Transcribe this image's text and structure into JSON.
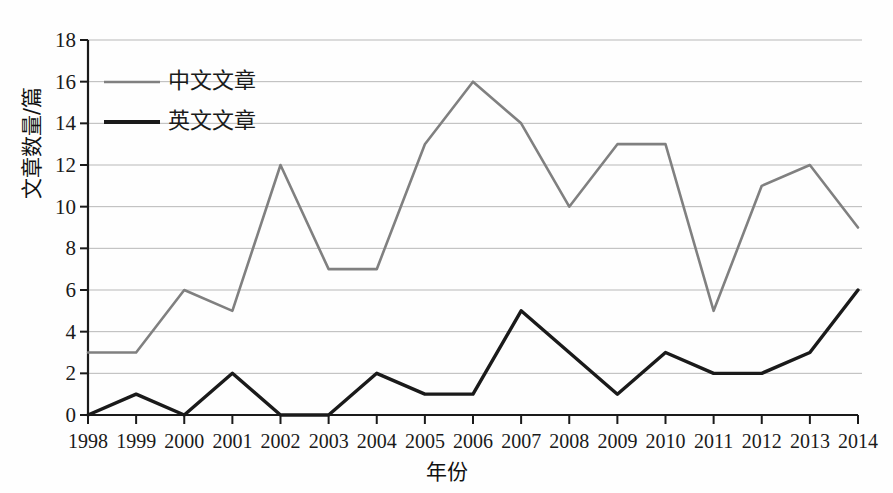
{
  "chart_data": {
    "type": "line",
    "title": "",
    "xlabel": "年份",
    "ylabel": "文章数量/篇",
    "categories": [
      "1998",
      "1999",
      "2000",
      "2001",
      "2002",
      "2003",
      "2004",
      "2005",
      "2006",
      "2007",
      "2008",
      "2009",
      "2010",
      "2011",
      "2012",
      "2013",
      "2014"
    ],
    "x": [
      1998,
      1999,
      2000,
      2001,
      2002,
      2003,
      2004,
      2005,
      2006,
      2007,
      2008,
      2009,
      2010,
      2011,
      2012,
      2013,
      2014
    ],
    "series": [
      {
        "name": "中文文章",
        "color": "#808080",
        "values": [
          3,
          3,
          6,
          5,
          12,
          7,
          7,
          13,
          16,
          14,
          10,
          13,
          13,
          5,
          11,
          12,
          9
        ]
      },
      {
        "name": "英文文章",
        "color": "#1a1a1a",
        "values": [
          0,
          1,
          0,
          2,
          0,
          0,
          2,
          1,
          1,
          5,
          3,
          1,
          3,
          2,
          2,
          3,
          6
        ]
      }
    ],
    "ylim": [
      0,
      18
    ],
    "yticks": [
      0,
      2,
      4,
      6,
      8,
      10,
      12,
      14,
      16,
      18
    ],
    "ytick_labels": [
      "0",
      "2",
      "4",
      "6",
      "8",
      "10",
      "12",
      "14",
      "16",
      "18"
    ],
    "grid": true,
    "grid_color": "#b8b8b8",
    "legend_position": "upper-left",
    "axis_color": "#1a1a1a"
  },
  "legend": {
    "entries": [
      {
        "label": "中文文章"
      },
      {
        "label": "英文文章"
      }
    ]
  }
}
